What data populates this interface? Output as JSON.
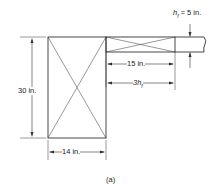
{
  "diagram": {
    "caption": "(a)",
    "labels": {
      "flange_thickness_sym": "h",
      "flange_thickness_sub": "f",
      "flange_thickness_val": " = 5 in.",
      "height": "30 in.",
      "web_width": "14 in.",
      "flange_overhang": "15 in.",
      "overhang_limit_coef": "3h",
      "overhang_limit_sub": "f"
    },
    "colors": {
      "line": "#333333",
      "text": "#222222"
    }
  }
}
